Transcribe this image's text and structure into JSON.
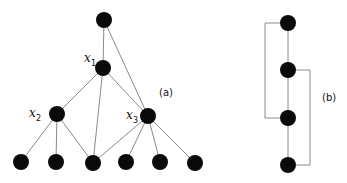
{
  "diagram": {
    "panel_a": {
      "label": "(a)",
      "node_labels": {
        "x1": {
          "var": "x",
          "sub": "1"
        },
        "x2": {
          "var": "x",
          "sub": "2"
        },
        "x3": {
          "var": "x",
          "sub": "3"
        }
      },
      "nodes": [
        {
          "id": "root",
          "x": 104,
          "y": 20
        },
        {
          "id": "x1",
          "x": 103,
          "y": 68
        },
        {
          "id": "x2",
          "x": 57,
          "y": 114
        },
        {
          "id": "x3",
          "x": 148,
          "y": 116
        },
        {
          "id": "l1",
          "x": 21,
          "y": 162
        },
        {
          "id": "l2",
          "x": 56,
          "y": 162
        },
        {
          "id": "l3",
          "x": 93,
          "y": 163
        },
        {
          "id": "l4",
          "x": 126,
          "y": 162
        },
        {
          "id": "l5",
          "x": 160,
          "y": 162
        },
        {
          "id": "l6",
          "x": 195,
          "y": 163
        }
      ],
      "edges": [
        [
          "root",
          "x1"
        ],
        [
          "root",
          "x3"
        ],
        [
          "x1",
          "x2"
        ],
        [
          "x1",
          "l3"
        ],
        [
          "x1",
          "x3"
        ],
        [
          "x2",
          "l1"
        ],
        [
          "x2",
          "l2"
        ],
        [
          "x2",
          "l3"
        ],
        [
          "x3",
          "l3"
        ],
        [
          "x3",
          "l4"
        ],
        [
          "x3",
          "l5"
        ],
        [
          "x3",
          "l6"
        ]
      ]
    },
    "panel_b": {
      "label": "(b)",
      "nodes": [
        {
          "id": "b1",
          "x": 288,
          "y": 23
        },
        {
          "id": "b2",
          "x": 288,
          "y": 70
        },
        {
          "id": "b3",
          "x": 288,
          "y": 118
        },
        {
          "id": "b4",
          "x": 288,
          "y": 165
        }
      ],
      "chain_edges": [
        [
          "b1",
          "b2"
        ],
        [
          "b2",
          "b3"
        ],
        [
          "b3",
          "b4"
        ]
      ],
      "bracket_edges": [
        {
          "from": "b1",
          "to": "b3",
          "side": "left",
          "x": 265
        },
        {
          "from": "b2",
          "to": "b4",
          "side": "right",
          "x": 310
        }
      ]
    }
  }
}
